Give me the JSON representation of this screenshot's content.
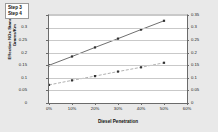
{
  "chart_data": {
    "type": "line",
    "title": "",
    "xlabel": "Diesel Penetration",
    "ylabel": "Effective NOx Standard Grams/Km",
    "xlim": [
      0,
      60
    ],
    "ylim": [
      0,
      0.35
    ],
    "grid": true,
    "legend_position": "top-left",
    "x": [
      0,
      10,
      20,
      30,
      40,
      50
    ],
    "x_tick_labels": [
      "0%",
      "10%",
      "20%",
      "30%",
      "40%",
      "50%",
      "60%"
    ],
    "x_ticks": [
      0,
      10,
      20,
      30,
      40,
      50,
      60
    ],
    "y_ticks": [
      0,
      0.05,
      0.1,
      0.15,
      0.2,
      0.25,
      0.3,
      0.35
    ],
    "y_tick_labels": [
      "0",
      "0.05",
      "0.1",
      "0.15",
      "0.2",
      "0.25",
      "0.3",
      "0.35"
    ],
    "y_tick_labels_right": [
      "0",
      "0.05",
      "0.1",
      "0.15",
      "0.2",
      "0.25",
      "0.3",
      "0.35"
    ],
    "series": [
      {
        "name": "Step 3",
        "values": [
          0.15,
          0.185,
          0.221,
          0.256,
          0.292,
          0.327
        ],
        "color": "#4a4a4a",
        "style": "solid",
        "marker": "square"
      },
      {
        "name": "Step 4",
        "values": [
          0.072,
          0.09,
          0.107,
          0.125,
          0.142,
          0.16
        ],
        "color": "#9d9d9d",
        "style": "dashed",
        "marker": "square"
      }
    ]
  },
  "legend": {
    "items": [
      {
        "label": "Step 3"
      },
      {
        "label": "Step 4"
      }
    ]
  },
  "axes": {
    "x_title": "Diesel Penetration",
    "y_title": "Effective NOx Standard Grams/Km"
  }
}
